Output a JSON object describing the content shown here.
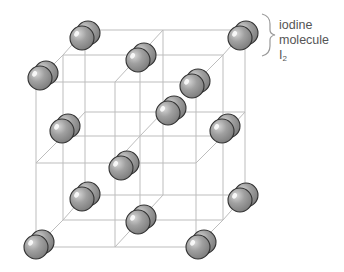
{
  "diagram": {
    "label": {
      "line1": "iodine",
      "line2": "molecule",
      "formula_base": "I",
      "formula_sub": "2"
    },
    "colors": {
      "grid_line": "#bdbdbd",
      "sphere_fill": "#9a9a9a",
      "sphere_outline": "#333333",
      "sphere_highlight": "#ffffff",
      "label_text": "#555555",
      "brace": "#999999"
    },
    "grid": {
      "layers": [
        {
          "name": "front",
          "x": [
            36,
            115,
            196
          ],
          "y": [
            82,
            163,
            247
          ]
        },
        {
          "name": "middle",
          "x": [
            63,
            140,
            223
          ],
          "y": [
            55,
            136,
            220
          ]
        },
        {
          "name": "back",
          "x": [
            85,
            163,
            245
          ],
          "y": [
            30,
            112,
            195
          ]
        }
      ]
    },
    "molecules": [
      {
        "x": 82,
        "y": 38
      },
      {
        "x": 240,
        "y": 38
      },
      {
        "x": 138,
        "y": 60
      },
      {
        "x": 40,
        "y": 78
      },
      {
        "x": 192,
        "y": 86
      },
      {
        "x": 168,
        "y": 113
      },
      {
        "x": 62,
        "y": 131
      },
      {
        "x": 222,
        "y": 131
      },
      {
        "x": 121,
        "y": 168
      },
      {
        "x": 82,
        "y": 199
      },
      {
        "x": 240,
        "y": 200
      },
      {
        "x": 138,
        "y": 222
      },
      {
        "x": 36,
        "y": 247
      },
      {
        "x": 198,
        "y": 247
      }
    ],
    "sphere_radius": 12,
    "pair_offset": {
      "dx": 6,
      "dy": -5
    }
  }
}
